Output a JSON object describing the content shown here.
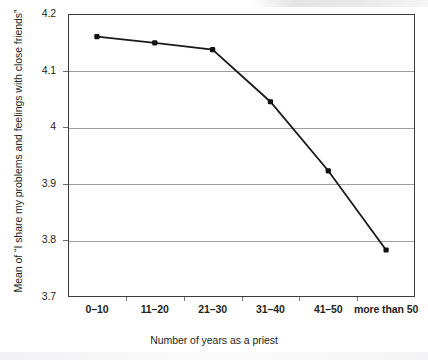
{
  "chart_data": {
    "type": "line",
    "title": "",
    "xlabel": "Number of years as a priest",
    "ylabel": "Mean of \"I share my problems and feelings with close friends\"",
    "categories": [
      "0–10",
      "11–20",
      "21–30",
      "31–40",
      "41–50",
      "more than 50"
    ],
    "values": [
      4.16,
      4.149,
      4.137,
      4.045,
      3.923,
      3.783
    ],
    "ylim": [
      3.7,
      4.2
    ],
    "ytick_labels": [
      "4.2",
      "4.1",
      "4",
      "3.9",
      "3.8",
      "3.7"
    ],
    "ytick_values": [
      4.2,
      4.1,
      4.0,
      3.9,
      3.8,
      3.7
    ],
    "grid": "horizontal",
    "legend": "none",
    "series": [
      {
        "name": "Mean agreement",
        "values": [
          4.16,
          4.149,
          4.137,
          4.045,
          3.923,
          3.783
        ]
      }
    ],
    "colors": {
      "line": "#1a1a1a",
      "marker": "#111111",
      "gridline": "#9d9d9d",
      "frame": "#3c3c3c",
      "text": "#231f20",
      "background": "#ffffff"
    }
  },
  "axis": {
    "y_title": "Mean of “I share my problems and feelings with close friends”",
    "x_title": "Number of years as a priest"
  }
}
